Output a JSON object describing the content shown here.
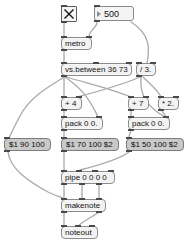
{
  "patch": {
    "title": "max-patch",
    "canvas": {
      "width": 195,
      "height": 248,
      "background": "#ffffff"
    },
    "colors": {
      "object_fill": "#f2f2f2",
      "object_border": "#8c8c8c",
      "message_fill": "#c9c9c9",
      "message_border": "#7d7d7d",
      "number_fill": "#f4f4f4",
      "cable": "#a7a7a7",
      "port": "#4a4a4a",
      "text": "#141414"
    },
    "objects": {
      "toggle": {
        "label": "",
        "kind": "toggle",
        "x": 61,
        "y": 6,
        "w": 16,
        "h": 16
      },
      "number_interval": {
        "label": "500",
        "kind": "number",
        "x": 94,
        "y": 6,
        "w": 40,
        "h": 15
      },
      "metro": {
        "label": "metro",
        "kind": "object",
        "x": 61,
        "y": 37,
        "w": 31,
        "h": 13
      },
      "vs_between": {
        "label": "vs.between 36 73",
        "kind": "object",
        "x": 61,
        "y": 63,
        "w": 71,
        "h": 13
      },
      "divide": {
        "label": "/ 3.",
        "kind": "object",
        "x": 136,
        "y": 63,
        "w": 20,
        "h": 13
      },
      "plus4": {
        "label": "+ 4",
        "kind": "object",
        "x": 61,
        "y": 97,
        "w": 21,
        "h": 13
      },
      "plus7": {
        "label": "+ 7",
        "kind": "object",
        "x": 128,
        "y": 97,
        "w": 21,
        "h": 13
      },
      "times2": {
        "label": "* 2.",
        "kind": "object",
        "x": 158,
        "y": 97,
        "w": 21,
        "h": 13
      },
      "pack_left": {
        "label": "pack 0 0.",
        "kind": "object",
        "x": 61,
        "y": 117,
        "w": 42,
        "h": 13
      },
      "pack_right": {
        "label": "pack 0 0.",
        "kind": "object",
        "x": 128,
        "y": 117,
        "w": 42,
        "h": 13
      },
      "msg_90": {
        "label": "$1 90 100",
        "kind": "message",
        "x": 4,
        "y": 138,
        "w": 47,
        "h": 13
      },
      "msg_70": {
        "label": "$1 70 100 $2",
        "kind": "message",
        "x": 61,
        "y": 138,
        "w": 58,
        "h": 13
      },
      "msg_50": {
        "label": "$1 50 100 $2",
        "kind": "message",
        "x": 126,
        "y": 138,
        "w": 58,
        "h": 13
      },
      "pipe": {
        "label": "pipe 0 0 0 0",
        "kind": "object",
        "x": 61,
        "y": 171,
        "w": 54,
        "h": 13
      },
      "makenote": {
        "label": "makenote",
        "kind": "object",
        "x": 61,
        "y": 199,
        "w": 45,
        "h": 13
      },
      "noteout": {
        "label": "noteout",
        "kind": "object",
        "x": 61,
        "y": 226,
        "w": 37,
        "h": 13
      }
    }
  }
}
